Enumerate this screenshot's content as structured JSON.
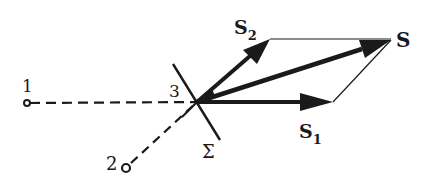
{
  "diagram": {
    "labels": {
      "point1": "1",
      "point2": "2",
      "point3": "3",
      "sigma": "Σ",
      "s1_main": "S",
      "s1_sub": "1",
      "s2_main": "S",
      "s2_sub": "2",
      "s_result": "S"
    },
    "colors": {
      "ink": "#1a1a1a",
      "background": "#ffffff"
    }
  }
}
